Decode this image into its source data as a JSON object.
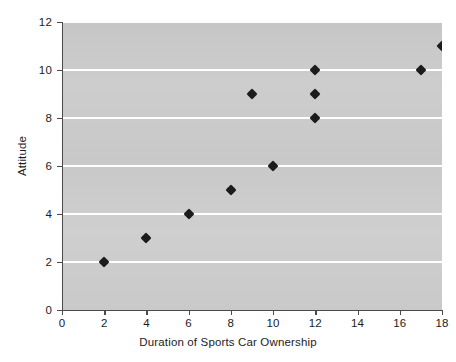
{
  "chart_data": {
    "type": "scatter",
    "title": "",
    "xlabel": "Duration of Sports Car Ownership",
    "ylabel": "Attitude",
    "xlim": [
      0,
      18
    ],
    "ylim": [
      0,
      12
    ],
    "x_ticks": [
      0,
      2,
      4,
      6,
      8,
      10,
      12,
      14,
      16,
      18
    ],
    "y_ticks": [
      0,
      2,
      4,
      6,
      8,
      10,
      12
    ],
    "grid": "horizontal-white-at-even-y",
    "legend": "none",
    "marker": "diamond",
    "marker_color": "#1c1c1c",
    "plot_background": "#c9c9c9",
    "points": [
      {
        "x": 2,
        "y": 2
      },
      {
        "x": 4,
        "y": 3
      },
      {
        "x": 6,
        "y": 4
      },
      {
        "x": 8,
        "y": 5
      },
      {
        "x": 9,
        "y": 9
      },
      {
        "x": 10,
        "y": 6
      },
      {
        "x": 12,
        "y": 8
      },
      {
        "x": 12,
        "y": 9
      },
      {
        "x": 12,
        "y": 10
      },
      {
        "x": 17,
        "y": 10
      },
      {
        "x": 18,
        "y": 11
      }
    ]
  },
  "axes": {
    "x_tick_labels": [
      "0",
      "2",
      "4",
      "6",
      "8",
      "10",
      "12",
      "14",
      "16",
      "18"
    ],
    "y_tick_labels": [
      "0",
      "2",
      "4",
      "6",
      "8",
      "10",
      "12"
    ],
    "x_title": "Duration of Sports Car Ownership",
    "y_title": "Attitude"
  }
}
